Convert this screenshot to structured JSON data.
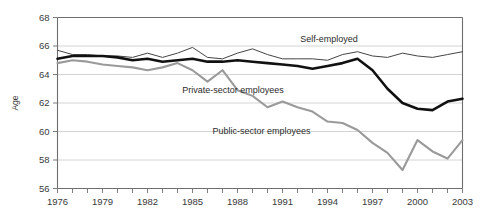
{
  "chart_data": {
    "type": "line",
    "title": "",
    "xlabel": "",
    "ylabel": "Age",
    "xlim": [
      1976,
      2003
    ],
    "ylim": [
      56,
      68
    ],
    "ytick_values": [
      56,
      58,
      60,
      62,
      64,
      66,
      68
    ],
    "ytick_labels": [
      "56",
      "58",
      "60",
      "62",
      "64",
      "66",
      "68"
    ],
    "xtick_values": [
      1976,
      1977,
      1978,
      1979,
      1980,
      1981,
      1982,
      1983,
      1984,
      1985,
      1986,
      1987,
      1988,
      1989,
      1990,
      1991,
      1992,
      1993,
      1994,
      1995,
      1996,
      1997,
      1998,
      1999,
      2000,
      2001,
      2002,
      2003
    ],
    "xtick_labels_shown": [
      "1976",
      "1979",
      "1982",
      "1985",
      "1988",
      "1991",
      "1994",
      "1997",
      "2000",
      "2003"
    ],
    "grid": "horizontal",
    "legend_position": "inline-annotations",
    "x": [
      1976,
      1977,
      1978,
      1979,
      1980,
      1981,
      1982,
      1983,
      1984,
      1985,
      1986,
      1987,
      1988,
      1989,
      1990,
      1991,
      1992,
      1993,
      1994,
      1995,
      1996,
      1997,
      1998,
      1999,
      2000,
      2001,
      2002,
      2003
    ],
    "series": [
      {
        "name": "Self-employed",
        "color": "#444444",
        "width": 1.0,
        "label_x": 1994.1,
        "label_y": 66.25,
        "values": [
          65.7,
          65.4,
          65.4,
          65.3,
          65.3,
          65.2,
          65.5,
          65.2,
          65.5,
          65.9,
          65.2,
          65.1,
          65.5,
          65.8,
          65.4,
          65.1,
          65.1,
          65.1,
          65.0,
          65.4,
          65.6,
          65.3,
          65.2,
          65.5,
          65.3,
          65.2,
          65.4,
          65.6
        ]
      },
      {
        "name": "Private-sector employees",
        "color": "#111111",
        "width": 2.6,
        "label_x": 1987.7,
        "label_y": 62.7,
        "values": [
          65.1,
          65.3,
          65.3,
          65.3,
          65.2,
          65.0,
          65.1,
          64.9,
          65.0,
          65.1,
          64.9,
          64.9,
          65.0,
          64.9,
          64.8,
          64.7,
          64.6,
          64.4,
          64.6,
          64.8,
          65.1,
          64.3,
          63.0,
          62.0,
          61.6,
          61.5,
          62.1,
          62.3
        ]
      },
      {
        "name": "Public-sector employees",
        "color": "#9a9a9a",
        "width": 2.1,
        "label_x": 1989.6,
        "label_y": 59.8,
        "values": [
          64.8,
          65.0,
          64.9,
          64.7,
          64.6,
          64.5,
          64.3,
          64.5,
          64.8,
          64.3,
          63.5,
          64.3,
          62.9,
          62.5,
          61.7,
          62.1,
          61.7,
          61.4,
          60.7,
          60.6,
          60.1,
          59.2,
          58.5,
          57.3,
          59.4,
          58.6,
          58.1,
          59.4
        ]
      }
    ]
  }
}
